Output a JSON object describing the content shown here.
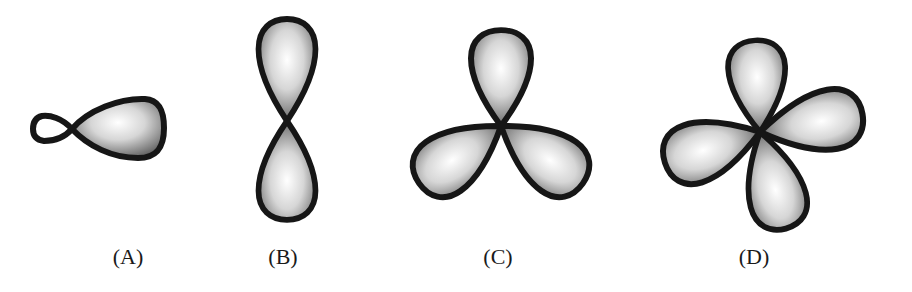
{
  "figure": {
    "colors": {
      "outline": "#161616",
      "lobe_highlight": "#ffffff",
      "lobe_shadow": "#5a5a5a",
      "background": "#ffffff",
      "label": "#1a1a1a"
    },
    "panels": [
      {
        "id": "A",
        "label": "(A)",
        "shape": "hybrid orbital: one large lobe with a small opposite lobe (horizontal)"
      },
      {
        "id": "B",
        "label": "(B)",
        "shape": "p orbital: two equal lobes, vertical"
      },
      {
        "id": "C",
        "label": "(C)",
        "shape": "three lobes arranged trigonally"
      },
      {
        "id": "D",
        "label": "(D)",
        "shape": "four lobes arranged in a cross-like pattern"
      }
    ]
  }
}
